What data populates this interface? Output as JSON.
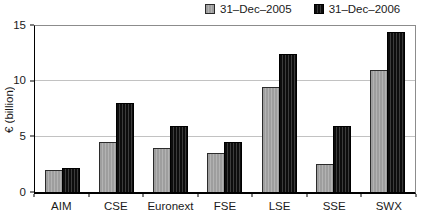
{
  "chart_data": {
    "type": "bar",
    "title": "",
    "xlabel": "",
    "ylabel": "€ (billion)",
    "ylim": [
      0,
      15
    ],
    "yticks": [
      0,
      5,
      10,
      15
    ],
    "gridlines": [
      5,
      10
    ],
    "grid": "horizontal",
    "legend_position": "top-right",
    "categories": [
      "AIM",
      "CSE",
      "Euronext",
      "FSE",
      "LSE",
      "SSE",
      "SWX"
    ],
    "series": [
      {
        "name": "31–Dec–2005",
        "values": [
          2,
          4.5,
          4,
          3.5,
          9.5,
          2.5,
          11
        ],
        "color": "#a9a9a9",
        "pattern": "solid-gray"
      },
      {
        "name": "31–Dec–2006",
        "values": [
          2.2,
          8,
          6,
          4.5,
          12.5,
          6,
          14.5
        ],
        "color": "#1c1c1c",
        "pattern": "dark-vertical-stripes"
      }
    ],
    "colors": {
      "gridline": "#c2c2c2",
      "axis": "#000000",
      "frame": "#8c8c8c",
      "background": "#ffffff"
    }
  }
}
